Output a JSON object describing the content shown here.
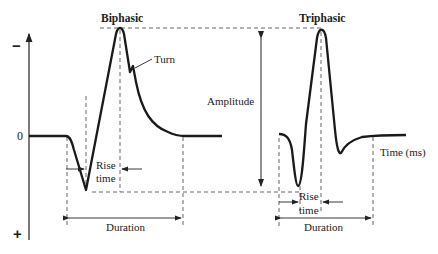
{
  "diagram": {
    "titles": {
      "biphasic": "Biphasic",
      "triphasic": "Triphasic"
    },
    "axis": {
      "negative_symbol": "−",
      "zero_label": "0",
      "positive_symbol": "+",
      "x_label": "Time (ms)"
    },
    "annotations": {
      "turn": "Turn",
      "amplitude": "Amplitude",
      "rise_time_biphasic": [
        "Rise",
        "time"
      ],
      "rise_time_triphasic": [
        "Rise",
        "time"
      ],
      "duration_biphasic": "Duration",
      "duration_triphasic": "Duration"
    },
    "colors": {
      "line": "#1a1a1a",
      "dashed": "#555555",
      "background": "#ffffff"
    }
  }
}
